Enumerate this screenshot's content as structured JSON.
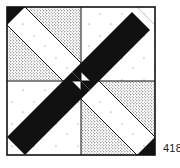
{
  "figure": {
    "type": "quilt-block-diagram",
    "number_label": "418",
    "colors": {
      "ink": "#111111",
      "paper": "#ffffff",
      "stipple": "#333333"
    },
    "regions": [
      {
        "name": "diagonal-band-black",
        "fill": "black"
      },
      {
        "name": "diagonal-band-white",
        "fill": "white-dotted"
      },
      {
        "name": "corner-triangles",
        "fill": "stipple"
      },
      {
        "name": "center-pinwheel",
        "fill": "black-white"
      }
    ]
  }
}
